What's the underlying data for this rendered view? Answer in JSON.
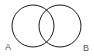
{
  "diagram": {
    "type": "venn",
    "sets": [
      {
        "label": "A",
        "cx": 33,
        "cy": 26,
        "r": 21
      },
      {
        "label": "B",
        "cx": 60,
        "cy": 26,
        "r": 21
      }
    ],
    "stroke_color": "#1a1a1a",
    "label_color": "#555555"
  },
  "labels": {
    "a": "A",
    "b": "B"
  }
}
